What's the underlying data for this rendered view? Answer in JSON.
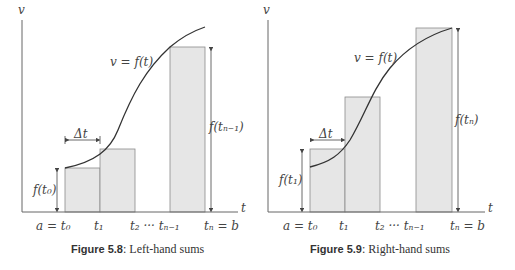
{
  "figures": [
    {
      "id": "left",
      "axis_y_label": "v",
      "axis_x_label": "t",
      "curve_label": "v = f(t)",
      "delta_label": "Δt",
      "height_small_label": "f(t₀)",
      "height_big_label": "f(tₙ₋₁)",
      "tick_labels": [
        "a = t₀",
        "t₁",
        "t₂ ··· tₙ₋₁",
        "tₙ = b"
      ],
      "caption_number": "Figure 5.8",
      "caption_text": ": Left-hand sums"
    },
    {
      "id": "right",
      "axis_y_label": "v",
      "axis_x_label": "t",
      "curve_label": "v = f(t)",
      "delta_label": "Δt",
      "height_small_label": "f(t₁)",
      "height_big_label": "f(tₙ)",
      "tick_labels": [
        "a = t₀",
        "t₁",
        "t₂ ··· tₙ₋₁",
        "tₙ = b"
      ],
      "caption_number": "Figure 5.9",
      "caption_text": ": Right-hand sums"
    }
  ],
  "colors": {
    "rect_fill": "#e6e6e6",
    "rect_stroke": "#8a8a8a",
    "axis": "#666666",
    "curve": "#333333"
  }
}
